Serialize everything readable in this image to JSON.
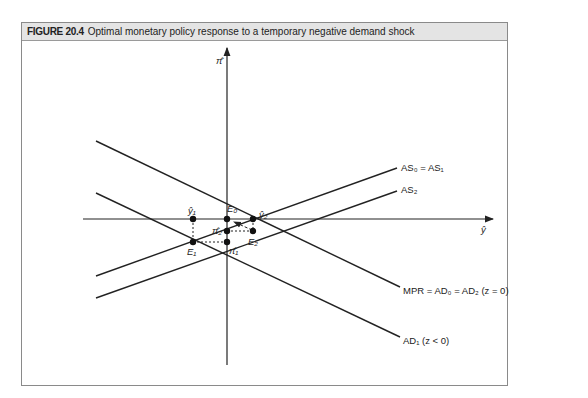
{
  "figure": {
    "number": "FIGURE 20.4",
    "title": "Optimal monetary policy response to a temporary negative demand shock"
  },
  "axes": {
    "x_label": "ŷ",
    "y_label": "π̂"
  },
  "curves": {
    "as01": "AS₀ = AS₁",
    "as2": "AS₂",
    "mpr": "MPR = AD₀ = AD₂ (z = 0)",
    "ad1": "AD₁ (z < 0)"
  },
  "points": {
    "e0": "E₀",
    "e1": "E₁",
    "e2": "E₂",
    "y1": "ŷ₁",
    "y2": "ŷ₂",
    "pi1": "π̂₁",
    "pi2": "π̂₂"
  },
  "colors": {
    "line": "#222222",
    "frame": "#8a8a8a",
    "titlebar": "#e4e4e4"
  }
}
